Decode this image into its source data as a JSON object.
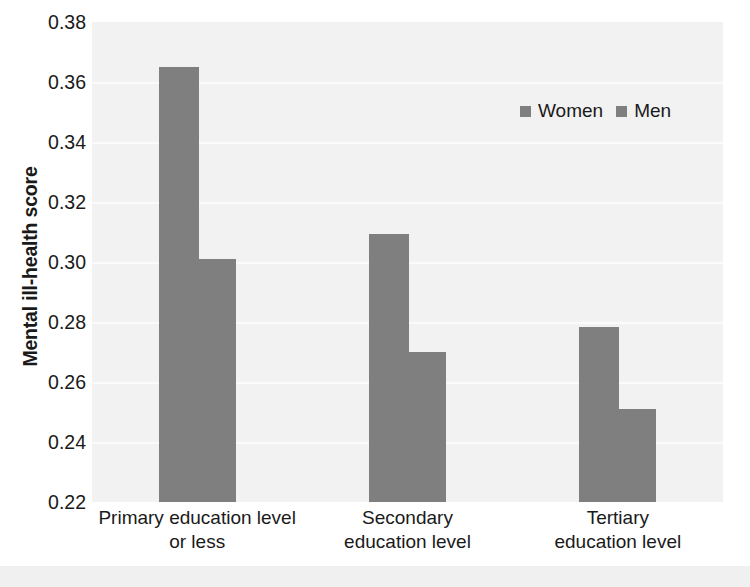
{
  "chart_data": {
    "type": "bar",
    "title": "",
    "xlabel": "",
    "ylabel": "Mental ill-health score",
    "categories": [
      "Primary education level\nor less",
      "Secondary\neducation level",
      "Tertiary\neducation level"
    ],
    "series": [
      {
        "name": "Women",
        "values": [
          0.365,
          0.3095,
          0.2785
        ],
        "color": "#7f7f7f"
      },
      {
        "name": "Men",
        "values": [
          0.301,
          0.27,
          0.251
        ],
        "color": "#7f7f7f"
      }
    ],
    "ylim": [
      0.22,
      0.38
    ],
    "ytick_labels": [
      "0.38",
      "0.36",
      "0.34",
      "0.32",
      "0.30",
      "0.28",
      "0.26",
      "0.24",
      "0.22"
    ],
    "ytick_values": [
      0.38,
      0.36,
      0.34,
      0.32,
      0.3,
      0.28,
      0.26,
      0.24,
      0.22
    ],
    "grid": true,
    "legend_position": "top-right",
    "plot_background": "#f2f2f2",
    "gridline_color": "#fbfbfb",
    "bar_color": "#7f7f7f"
  },
  "legend": {
    "items": [
      {
        "label": "Women"
      },
      {
        "label": "Men"
      }
    ]
  }
}
